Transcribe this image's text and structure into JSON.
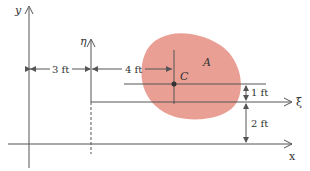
{
  "diagram": {
    "axes": {
      "y_label": "y",
      "x_label": "x",
      "eta_label": "η",
      "xi_label": "ξ"
    },
    "area_label": "A",
    "centroid_label": "C",
    "dimensions": {
      "horizontal_offset": "3 ft",
      "centroid_x": "4 ft",
      "centroid_y": "1 ft",
      "vertical_offset": "2 ft"
    },
    "colors": {
      "area_fill": "#e8958a",
      "line": "#555555"
    }
  }
}
